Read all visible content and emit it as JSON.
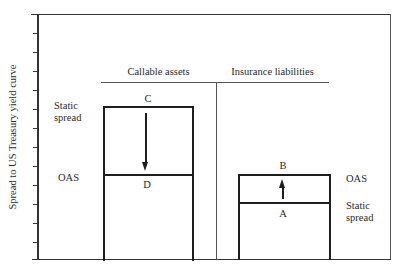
{
  "diagram": {
    "y_axis_label": "Spread to US Treasury yield curve",
    "columns": {
      "left": {
        "header": "Callable assets"
      },
      "right": {
        "header": "Insurance liabilities"
      }
    },
    "left_labels": {
      "static_spread_line1": "Static",
      "static_spread_line2": "spread",
      "oas": "OAS"
    },
    "right_labels": {
      "oas": "OAS",
      "static_spread_line1": "Static",
      "static_spread_line2": "spread"
    },
    "points": {
      "C": "C",
      "D": "D",
      "B": "B",
      "A": "A"
    },
    "arrows": [
      {
        "from": "C",
        "to": "D",
        "direction": "down",
        "meaning": "Callable assets: OAS below static spread"
      },
      {
        "from": "A",
        "to": "B",
        "direction": "up",
        "meaning": "Insurance liabilities: OAS above static spread"
      }
    ],
    "y_axis_ticks": 12
  }
}
